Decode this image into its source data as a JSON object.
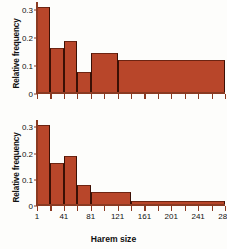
{
  "figure": {
    "xlabel": "Harem size",
    "ylabel": "Relative frequency"
  },
  "chart_data": [
    {
      "type": "bar",
      "panel": "top",
      "title": "",
      "xlabel": "",
      "ylabel": "Relative frequency",
      "xlim": [
        1,
        281
      ],
      "ylim": [
        0,
        0.32
      ],
      "yticks": [
        0,
        0.1,
        0.2,
        0.3
      ],
      "ytick_labels": [
        "0",
        "0.1",
        "0.2",
        "0.3"
      ],
      "xticks": [
        1,
        21,
        41,
        61,
        81,
        101,
        121,
        141,
        161,
        181,
        201,
        221,
        241,
        261,
        281
      ],
      "xtick_labels": [
        "",
        "",
        "",
        "",
        "",
        "",
        "",
        "",
        "",
        "",
        "",
        "",
        "",
        "",
        ""
      ],
      "grid": false,
      "legend": null,
      "bins": [
        {
          "x0": 1,
          "x1": 21,
          "value": 0.31
        },
        {
          "x0": 21,
          "x1": 41,
          "value": 0.165
        },
        {
          "x0": 41,
          "x1": 61,
          "value": 0.19
        },
        {
          "x0": 61,
          "x1": 81,
          "value": 0.08
        },
        {
          "x0": 81,
          "x1": 121,
          "value": 0.145
        },
        {
          "x0": 121,
          "x1": 281,
          "value": 0.12
        }
      ]
    },
    {
      "type": "bar",
      "panel": "bottom",
      "title": "",
      "xlabel": "Harem size",
      "ylabel": "Relative frequency",
      "xlim": [
        1,
        281
      ],
      "ylim": [
        0,
        0.32
      ],
      "yticks": [
        0,
        0.1,
        0.2,
        0.3
      ],
      "ytick_labels": [
        "0",
        "0.1",
        "0.2",
        "0.3"
      ],
      "xticks": [
        1,
        21,
        41,
        61,
        81,
        101,
        121,
        141,
        161,
        181,
        201,
        221,
        241,
        261,
        281
      ],
      "xtick_labels": [
        "1",
        "",
        "41",
        "",
        "81",
        "",
        "121",
        "",
        "161",
        "",
        "201",
        "",
        "241",
        "",
        "281"
      ],
      "grid": false,
      "legend": null,
      "bins": [
        {
          "x0": 1,
          "x1": 21,
          "value": 0.31
        },
        {
          "x0": 21,
          "x1": 41,
          "value": 0.165
        },
        {
          "x0": 41,
          "x1": 61,
          "value": 0.19
        },
        {
          "x0": 61,
          "x1": 81,
          "value": 0.08
        },
        {
          "x0": 81,
          "x1": 141,
          "value": 0.053
        },
        {
          "x0": 141,
          "x1": 281,
          "value": 0.021
        }
      ]
    }
  ],
  "colors": {
    "bar_fill": "#b8462a",
    "bar_edge": "#3a1005",
    "axis": "#8a3a22",
    "text": "#111111",
    "background": "#fdfdfb"
  }
}
